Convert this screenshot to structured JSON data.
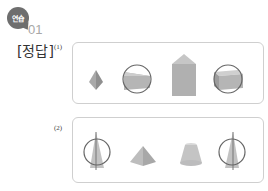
{
  "header": {
    "badge_label": "연습",
    "problem_number": "01",
    "answer_label": "[정답]"
  },
  "parts": [
    {
      "label": "(1)",
      "figures": [
        "square-pyramid",
        "triangular-prism-circled",
        "pentagonal-prism",
        "rectangular-prism-circled"
      ]
    },
    {
      "label": "(2)",
      "figures": [
        "cone-circled",
        "square-pyramid",
        "truncated-cone",
        "cone-circled"
      ]
    }
  ],
  "colors": {
    "badge": "#6e6e6e",
    "number": "#a8a8a8",
    "box_border": "#cfcfcf",
    "shape_fill": "#b5b5b5"
  }
}
